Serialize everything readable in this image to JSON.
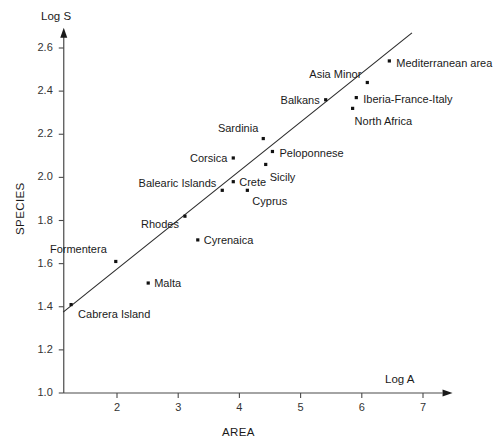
{
  "chart_data": {
    "type": "scatter",
    "title": "",
    "xlabel": "AREA",
    "ylabel": "SPECIES",
    "x_axis_symbol": "Log A",
    "y_axis_symbol": "Log S",
    "xlim": [
      1.13,
      7.45
    ],
    "ylim": [
      1.0,
      2.68
    ],
    "xticks": [
      2,
      3,
      4,
      5,
      6,
      7
    ],
    "xtick_labels": [
      "2",
      "3",
      "4",
      "5",
      "6",
      "7"
    ],
    "yticks": [
      1.0,
      1.2,
      1.4,
      1.6,
      1.8,
      2.0,
      2.2,
      2.4,
      2.6
    ],
    "ytick_labels": [
      "1.0",
      "1.2",
      "1.4",
      "1.6",
      "1.8",
      "2.0",
      "2.2",
      "2.4",
      "2.6"
    ],
    "grid": false,
    "legend": "none",
    "points": [
      {
        "label": "Cabrera Island",
        "x": 1.25,
        "y": 1.41,
        "label_dx": 7,
        "label_dy": 13,
        "align": "left"
      },
      {
        "label": "Formentera",
        "x": 1.98,
        "y": 1.61,
        "label_dx": -9,
        "label_dy": -8,
        "align": "right"
      },
      {
        "label": "Malta",
        "x": 2.51,
        "y": 1.51,
        "label_dx": 6,
        "label_dy": 4,
        "align": "left"
      },
      {
        "label": "Rhodes",
        "x": 3.11,
        "y": 1.82,
        "label_dx": -6,
        "label_dy": 12,
        "align": "right"
      },
      {
        "label": "Cyrenaica",
        "x": 3.32,
        "y": 1.71,
        "label_dx": 6,
        "label_dy": 4,
        "align": "left"
      },
      {
        "label": "Balearic Islands",
        "x": 3.72,
        "y": 1.94,
        "label_dx": -6,
        "label_dy": -3,
        "align": "right"
      },
      {
        "label": "Crete",
        "x": 3.9,
        "y": 1.98,
        "label_dx": 6,
        "label_dy": 4,
        "align": "left"
      },
      {
        "label": "Cyprus",
        "x": 4.13,
        "y": 1.94,
        "label_dx": 5,
        "label_dy": 15,
        "align": "left"
      },
      {
        "label": "Corsica",
        "x": 3.9,
        "y": 2.09,
        "label_dx": -6,
        "label_dy": 4,
        "align": "right"
      },
      {
        "label": "Sardinia",
        "x": 4.39,
        "y": 2.18,
        "label_dx": -5,
        "label_dy": -7,
        "align": "right"
      },
      {
        "label": "Peloponnese",
        "x": 4.54,
        "y": 2.12,
        "label_dx": 7,
        "label_dy": 5,
        "align": "left"
      },
      {
        "label": "Sicily",
        "x": 4.43,
        "y": 2.06,
        "label_dx": 4,
        "label_dy": 17,
        "align": "left"
      },
      {
        "label": "Balkans",
        "x": 5.41,
        "y": 2.36,
        "label_dx": -6,
        "label_dy": 4,
        "align": "right"
      },
      {
        "label": "North Africa",
        "x": 5.85,
        "y": 2.32,
        "label_dx": 2,
        "label_dy": 17,
        "align": "left"
      },
      {
        "label": "Iberia-France-Italy",
        "x": 5.91,
        "y": 2.37,
        "label_dx": 7,
        "label_dy": 5,
        "align": "left"
      },
      {
        "label": "Asia Minor",
        "x": 6.09,
        "y": 2.44,
        "label_dx": -6,
        "label_dy": -5,
        "align": "right"
      },
      {
        "label": "Mediterranean area",
        "x": 6.45,
        "y": 2.54,
        "label_dx": 7,
        "label_dy": 6,
        "align": "left"
      }
    ],
    "fit_line": {
      "x0": 1.12,
      "y0": 1.375,
      "x1": 6.82,
      "y1": 2.67
    }
  }
}
